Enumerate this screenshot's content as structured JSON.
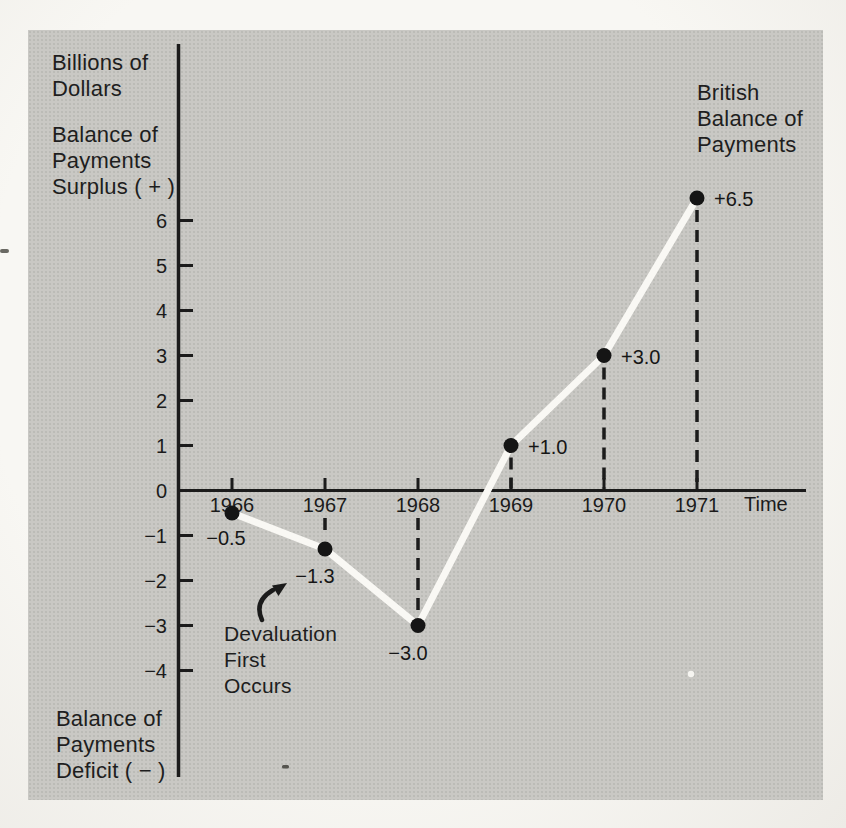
{
  "page": {
    "colors": {
      "paper": "#f4f3ef",
      "panel": "#c9c8c4",
      "ink": "#1b1b1b",
      "line": "#f9f8f4",
      "point": "#151515"
    }
  },
  "labels": {
    "y_axis_unit": "Billions of\nDollars",
    "y_axis_positive": "Balance of\nPayments\nSurplus ( + )",
    "y_axis_negative": "Balance of\nPayments\nDeficit ( − )",
    "series_title": "British\nBalance of\nPayments",
    "x_axis": "Time"
  },
  "annotation": {
    "text": "Devaluation\nFirst\nOccurs",
    "points_at": "line segment between 1967 and 1968"
  },
  "chart_data": {
    "type": "line",
    "title": "British Balance of Payments",
    "xlabel": "Time",
    "ylabel": "Billions of Dollars",
    "categories": [
      "1966",
      "1967",
      "1968",
      "1969",
      "1970",
      "1971"
    ],
    "values": [
      -0.5,
      -1.3,
      -3.0,
      1.0,
      3.0,
      6.5
    ],
    "yticks": [
      6,
      5,
      4,
      3,
      2,
      1,
      0,
      -1,
      -2,
      -3,
      -4
    ],
    "ylim": [
      -4.5,
      7.2
    ],
    "grid": false,
    "legend_position": "none",
    "points": [
      {
        "year": "1966",
        "value": -0.5,
        "label": "−0.5",
        "label_side": "below-left",
        "dropline": false
      },
      {
        "year": "1967",
        "value": -1.3,
        "label": "−1.3",
        "label_side": "below",
        "dropline": true
      },
      {
        "year": "1968",
        "value": -3.0,
        "label": "−3.0",
        "label_side": "below",
        "dropline": true
      },
      {
        "year": "1969",
        "value": 1.0,
        "label": "+1.0",
        "label_side": "right",
        "dropline": true
      },
      {
        "year": "1970",
        "value": 3.0,
        "label": "+3.0",
        "label_side": "right",
        "dropline": true
      },
      {
        "year": "1971",
        "value": 6.5,
        "label": "+6.5",
        "label_side": "right",
        "dropline": true
      }
    ]
  }
}
